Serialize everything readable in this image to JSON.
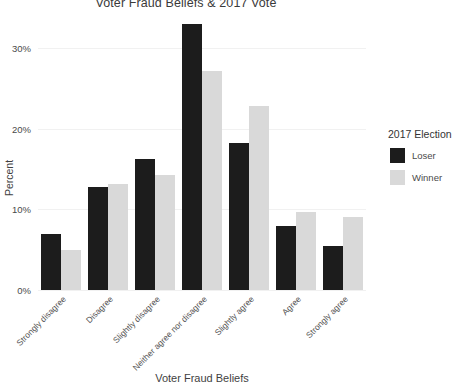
{
  "chart_data": {
    "type": "bar",
    "title": "Voter Fraud Beliefs & 2017 Vote",
    "xlabel": "Voter Fraud Beliefs",
    "ylabel": "Percent",
    "ylim": [
      0,
      33
    ],
    "grid": true,
    "legend_position": "right",
    "yticks": [
      {
        "value": 0,
        "label": "0%"
      },
      {
        "value": 10,
        "label": "10%"
      },
      {
        "value": 20,
        "label": "20%"
      },
      {
        "value": 30,
        "label": "30%"
      }
    ],
    "categories": [
      "Strongly disagree",
      "Disagree",
      "Slightly disagree",
      "Neither agree nor disagree",
      "Slightly agree",
      "Agree",
      "Strongly agree"
    ],
    "series": [
      {
        "name": "Loser",
        "color": "#1c1c1c",
        "values": [
          7.0,
          12.8,
          16.2,
          33.0,
          18.3,
          8.0,
          5.4
        ]
      },
      {
        "name": "Winner",
        "color": "#d9d9d9",
        "values": [
          5.0,
          13.2,
          14.3,
          27.2,
          22.8,
          9.7,
          9.0
        ]
      }
    ]
  },
  "legend": {
    "title": "2017 Election",
    "items": [
      {
        "label": "Loser"
      },
      {
        "label": "Winner"
      }
    ]
  }
}
